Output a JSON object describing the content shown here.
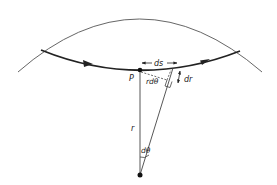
{
  "diagram": {
    "type": "orbit-geometry",
    "labels": {
      "point": "P",
      "arc_length": "ds",
      "radial_change": "dr",
      "tangential": "rdθ",
      "radius": "r",
      "angle": "dθ"
    },
    "colors": {
      "line": "#222222",
      "thin_line": "#555555",
      "background": "#ffffff"
    }
  }
}
